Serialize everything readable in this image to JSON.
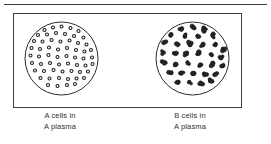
{
  "figure": {
    "background_color": "#ffffff",
    "ink_color": "#2b2b2b",
    "frame": {
      "border_color": "#3f3f3f",
      "border_width": 1,
      "x": 13,
      "y": 13,
      "width": 229,
      "height": 95
    },
    "top_rule": {
      "color": "#3a3a3a",
      "x": 4,
      "y": 4,
      "width": 263,
      "height": 1
    }
  },
  "panels": [
    {
      "id": "left",
      "name": "a-cells-in-a-plasma",
      "caption_lines": [
        "A cells in",
        "A plasma"
      ],
      "result": "no agglutination",
      "dish": {
        "cx": 37.5,
        "cy": 38.5,
        "r": 36.5,
        "stroke_color": "#2b2b2b",
        "stroke_width": 1,
        "fill": "#ffffff"
      },
      "cells": {
        "style": "dispersed",
        "shape": "ring",
        "count": 58,
        "radius": 1.5,
        "stroke_color": "#232323",
        "fill_color": "#ffffff",
        "points": [
          [
            20.5,
            10.0
          ],
          [
            29.0,
            7.5
          ],
          [
            37.5,
            6.5
          ],
          [
            46.5,
            8.0
          ],
          [
            54.5,
            11.0
          ],
          [
            14.0,
            15.0
          ],
          [
            23.0,
            14.5
          ],
          [
            32.0,
            13.0
          ],
          [
            41.0,
            14.0
          ],
          [
            50.0,
            16.0
          ],
          [
            59.5,
            17.5
          ],
          [
            10.0,
            21.0
          ],
          [
            18.5,
            21.5
          ],
          [
            27.5,
            20.0
          ],
          [
            36.5,
            21.5
          ],
          [
            45.5,
            20.5
          ],
          [
            54.0,
            23.0
          ],
          [
            62.5,
            24.5
          ],
          [
            7.5,
            28.0
          ],
          [
            16.0,
            29.0
          ],
          [
            25.0,
            27.5
          ],
          [
            34.0,
            29.5
          ],
          [
            43.0,
            28.0
          ],
          [
            52.0,
            30.0
          ],
          [
            60.5,
            31.5
          ],
          [
            67.0,
            30.0
          ],
          [
            6.5,
            35.5
          ],
          [
            15.0,
            36.5
          ],
          [
            24.5,
            35.0
          ],
          [
            33.5,
            37.0
          ],
          [
            42.5,
            36.0
          ],
          [
            51.0,
            37.5
          ],
          [
            59.5,
            38.5
          ],
          [
            68.0,
            37.5
          ],
          [
            8.0,
            43.0
          ],
          [
            17.0,
            44.0
          ],
          [
            26.0,
            43.0
          ],
          [
            35.0,
            44.5
          ],
          [
            44.0,
            43.5
          ],
          [
            53.0,
            45.0
          ],
          [
            61.5,
            45.5
          ],
          [
            68.5,
            44.0
          ],
          [
            11.0,
            50.5
          ],
          [
            20.0,
            51.0
          ],
          [
            29.5,
            50.0
          ],
          [
            38.5,
            51.5
          ],
          [
            47.5,
            51.0
          ],
          [
            56.0,
            52.0
          ],
          [
            64.0,
            51.5
          ],
          [
            16.5,
            58.0
          ],
          [
            25.5,
            58.5
          ],
          [
            35.0,
            58.0
          ],
          [
            44.0,
            59.0
          ],
          [
            52.5,
            58.5
          ],
          [
            60.0,
            58.0
          ],
          [
            24.0,
            65.0
          ],
          [
            33.5,
            66.0
          ],
          [
            43.0,
            65.0
          ],
          [
            51.0,
            64.0
          ]
        ]
      }
    },
    {
      "id": "right",
      "name": "b-cells-in-a-plasma",
      "caption_lines": [
        "B cells in",
        "A plasma"
      ],
      "result": "agglutination",
      "dish": {
        "cx": 37.5,
        "cy": 38.5,
        "r": 36.5,
        "stroke_color": "#2b2b2b",
        "stroke_width": 1,
        "fill": "#ffffff"
      },
      "cells": {
        "style": "clumped",
        "shape": "cluster",
        "count": 34,
        "radius": 3.0,
        "stroke_color": "#1a1a1a",
        "fill_color": "#262626",
        "points": [
          [
            27.0,
            8.5
          ],
          [
            38.0,
            7.0
          ],
          [
            49.0,
            9.5
          ],
          [
            16.0,
            14.5
          ],
          [
            30.5,
            15.0
          ],
          [
            43.5,
            16.5
          ],
          [
            57.5,
            15.5
          ],
          [
            9.5,
            23.0
          ],
          [
            21.5,
            24.0
          ],
          [
            35.0,
            23.0
          ],
          [
            48.0,
            25.0
          ],
          [
            61.0,
            24.0
          ],
          [
            68.0,
            28.5
          ],
          [
            7.0,
            33.0
          ],
          [
            19.0,
            33.5
          ],
          [
            31.5,
            34.0
          ],
          [
            44.0,
            33.0
          ],
          [
            55.0,
            35.5
          ],
          [
            66.5,
            37.5
          ],
          [
            9.0,
            43.0
          ],
          [
            21.0,
            44.0
          ],
          [
            33.0,
            43.5
          ],
          [
            45.5,
            44.5
          ],
          [
            57.5,
            45.0
          ],
          [
            67.5,
            46.0
          ],
          [
            14.5,
            53.0
          ],
          [
            26.5,
            53.5
          ],
          [
            38.5,
            53.0
          ],
          [
            50.0,
            54.0
          ],
          [
            60.5,
            54.5
          ],
          [
            23.0,
            62.5
          ],
          [
            35.0,
            64.0
          ],
          [
            46.5,
            63.0
          ],
          [
            56.0,
            61.0
          ]
        ]
      }
    }
  ]
}
